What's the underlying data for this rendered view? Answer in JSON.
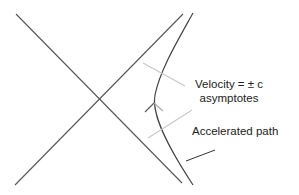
{
  "diagram": {
    "type": "spacetime-diagram",
    "labels": {
      "velocity_line1": "Velocity = ± c",
      "velocity_line2": "asymptotes",
      "accelerated_path": "Accelerated path"
    },
    "colors": {
      "background": "#ffffff",
      "lines": "#555555",
      "asymptote_markers": "#c8c8c8",
      "text": "#222222"
    },
    "elements": [
      {
        "name": "light-cone-line-descending",
        "from": [
          16,
          14
        ],
        "to": [
          182,
          183
        ]
      },
      {
        "name": "light-cone-line-ascending",
        "from": [
          183,
          14
        ],
        "to": [
          15,
          185
        ]
      },
      {
        "name": "hyperbolic-accelerated-path",
        "vertex": [
          155,
          100
        ]
      },
      {
        "name": "direction-arrow",
        "at": [
          154,
          103
        ],
        "direction": "up"
      }
    ]
  }
}
